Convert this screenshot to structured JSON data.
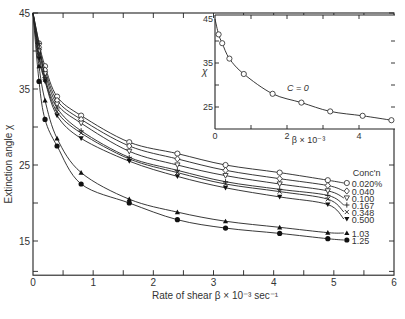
{
  "chart_data": [
    {
      "type": "line",
      "title": "",
      "xlabel": "Rate of shear β × 10⁻³ sec⁻¹",
      "ylabel": "Extinction angle χ",
      "xlim": [
        0,
        6
      ],
      "ylim": [
        10.5,
        45
      ],
      "xticks": [
        "0",
        "1",
        "2",
        "3",
        "4",
        "5",
        "6"
      ],
      "yticks": [
        "15",
        "25",
        "35",
        "45"
      ],
      "grid": false,
      "legend_title": "Conc'n",
      "legend_position": "right",
      "x": [
        0.1,
        0.2,
        0.4,
        0.8,
        1.6,
        2.4,
        3.2,
        4.1,
        4.9
      ],
      "series": [
        {
          "name": "0.020%",
          "marker": "open-circle",
          "values": [
            41,
            38,
            34,
            31.5,
            28,
            26.5,
            25,
            24,
            23
          ]
        },
        {
          "name": "0.040",
          "marker": "open-diamond",
          "values": [
            40.5,
            37.5,
            33.5,
            31,
            27.5,
            25.8,
            24.3,
            23.2,
            22.3
          ]
        },
        {
          "name": "0.100",
          "marker": "open-triangle-down",
          "values": [
            40,
            37,
            33,
            30.5,
            26.8,
            25,
            23.6,
            22.5,
            21.6
          ]
        },
        {
          "name": "0.167",
          "marker": "plus",
          "values": [
            41,
            36.5,
            32.5,
            29.5,
            26,
            24.3,
            22.8,
            21.8,
            21
          ]
        },
        {
          "name": "0.348",
          "marker": "x",
          "values": [
            39.5,
            36.2,
            32,
            29.2,
            25.8,
            24,
            22.5,
            21.5,
            20.5
          ]
        },
        {
          "name": "0.500",
          "marker": "filled-triangle-down",
          "values": [
            39,
            36,
            31.5,
            28.5,
            25.5,
            23.5,
            22,
            20.8,
            19.8
          ]
        },
        {
          "name": "1.03",
          "marker": "filled-triangle",
          "values": [
            38,
            33.5,
            28.5,
            24,
            20.5,
            18.8,
            17.6,
            16.8,
            16.1
          ]
        },
        {
          "name": "1.25",
          "marker": "filled-circle",
          "values": [
            36,
            31,
            27.5,
            22.5,
            20,
            17.8,
            16.7,
            16,
            15.3
          ]
        }
      ]
    },
    {
      "type": "line",
      "title": "",
      "annotation": "C = 0",
      "xlabel": "β × 10⁻³",
      "ylabel": "χ",
      "xlim": [
        0,
        5
      ],
      "ylim": [
        20,
        45
      ],
      "xticks": [
        "0",
        "2",
        "4"
      ],
      "yticks": [
        "25",
        "35",
        "45"
      ],
      "grid": false,
      "series": [
        {
          "name": "C = 0",
          "marker": "open-circle",
          "x": [
            0.1,
            0.2,
            0.4,
            0.8,
            1.6,
            2.4,
            3.2,
            4.1,
            4.9
          ],
          "values": [
            41.5,
            39.5,
            36,
            32.5,
            28,
            26,
            24,
            23,
            22
          ]
        }
      ]
    }
  ],
  "labels": {
    "ylabel": "Extinction angle χ",
    "xlabel_prefix": "Rate of shear ",
    "legend_title": "Conc'n",
    "inset_ylabel": "χ",
    "inset_annotation": "C = 0"
  }
}
